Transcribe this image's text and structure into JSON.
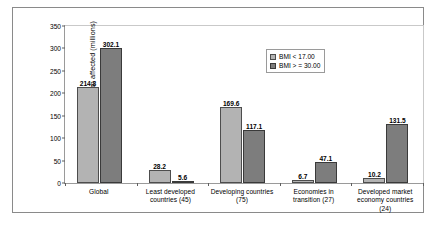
{
  "chart_data": {
    "type": "bar",
    "title": "",
    "xlabel": "",
    "ylabel": "Population affected (millions)",
    "ylim": [
      0,
      350
    ],
    "yticks": [
      "0",
      "50",
      "100",
      "150",
      "200",
      "250",
      "300",
      "350"
    ],
    "grid": false,
    "legend_position": "top-center-right",
    "categories": [
      "Global",
      "Least developed countries (45)",
      "Developing countries (75)",
      "Economies in transition (27)",
      "Developed market economy countries (24)"
    ],
    "category_lines": [
      [
        "Global"
      ],
      [
        "Least developed",
        "countries (45)"
      ],
      [
        "Developing countries",
        "(75)"
      ],
      [
        "Economies in",
        "transition (27)"
      ],
      [
        "Developed market",
        "economy countries",
        "(24)"
      ]
    ],
    "series": [
      {
        "name": "BMI < 17.00",
        "color": "#b3b3b3",
        "values": [
          214.8,
          28.2,
          169.6,
          6.7,
          10.2
        ]
      },
      {
        "name": "BMI > = 30.00",
        "color": "#7d7d7d",
        "values": [
          302.1,
          5.6,
          117.1,
          47.1,
          131.5
        ]
      }
    ]
  },
  "legend": {
    "items": [
      {
        "label": "BMI < 17.00",
        "swatch": "legend-swatch-light"
      },
      {
        "label": "BMI > = 30.00",
        "swatch": "legend-swatch-dark"
      }
    ]
  },
  "colors": {
    "series_light": "#b3b3b3",
    "series_dark": "#7d7d7d",
    "axis": "#5f5f5f",
    "border": "#8a8a8a",
    "background": "#ffffff"
  }
}
